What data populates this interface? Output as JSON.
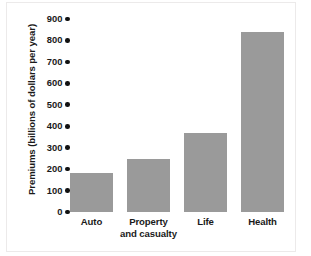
{
  "chart_data": {
    "type": "bar",
    "title": "",
    "xlabel": "",
    "ylabel": "Premiums (billions of dollars per year)",
    "categories": [
      "Auto",
      "Property and casualty",
      "Life",
      "Health"
    ],
    "category_lines": [
      [
        "Auto"
      ],
      [
        "Property",
        "and casualty"
      ],
      [
        "Life"
      ],
      [
        "Health"
      ]
    ],
    "values": [
      180,
      245,
      370,
      840
    ],
    "ylim": [
      0,
      900
    ],
    "yticks": [
      0,
      100,
      200,
      300,
      400,
      500,
      600,
      700,
      800,
      900
    ],
    "ytick_labels": [
      "0",
      "100",
      "200",
      "300",
      "400",
      "500",
      "600",
      "700",
      "800",
      "900"
    ],
    "grid": false,
    "legend": null,
    "bar_color": "#9a9a9a",
    "background_color": "#ffffff",
    "text_color": "#1a1a1a",
    "tick_marker": "round-dot"
  }
}
